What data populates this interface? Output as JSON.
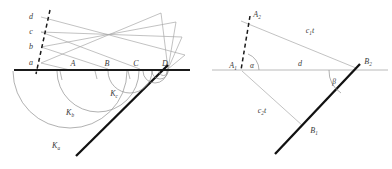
{
  "figure": {
    "panels": [
      {
        "id": "left",
        "name": "huygens-wavelets-panel",
        "baseline_label": "interface",
        "wavefront_labels": [
          "a",
          "b",
          "c",
          "d"
        ],
        "point_labels": [
          "A",
          "B",
          "C",
          "D"
        ],
        "arc_labels": [
          {
            "base": "K",
            "sub": "a"
          },
          {
            "base": "K",
            "sub": "b"
          },
          {
            "base": "K",
            "sub": "c"
          }
        ]
      },
      {
        "id": "right",
        "name": "refraction-angle-panel",
        "point_labels": [
          {
            "base": "A",
            "sub": "1"
          },
          {
            "base": "A",
            "sub": "2"
          },
          {
            "base": "B",
            "sub": "1"
          },
          {
            "base": "B",
            "sub": "2"
          }
        ],
        "segment_labels": [
          {
            "base": "c",
            "sub": "1",
            "tail": "t"
          },
          {
            "base": "c",
            "sub": "2",
            "tail": "t"
          },
          {
            "base": "d",
            "sub": "",
            "tail": ""
          }
        ],
        "angle_labels": [
          "α",
          "β"
        ]
      }
    ],
    "colors": {
      "ray": "#a8a8a8",
      "arc": "#8f8f8f",
      "thick": "#111111",
      "dash": "#1a1a1a",
      "text": "#3a3a3a",
      "background": "#ffffff"
    }
  }
}
